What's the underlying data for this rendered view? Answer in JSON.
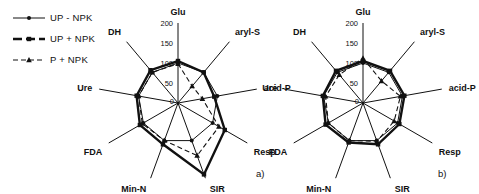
{
  "colors": {
    "line": "#111111",
    "background": "#ffffff"
  },
  "legend": {
    "items": [
      {
        "label": "UP - NPK",
        "marker": "circle",
        "line": "thin-solid"
      },
      {
        "label": "UP + NPK",
        "marker": "square",
        "line": "thick-solid"
      },
      {
        "label": "P + NPK",
        "marker": "triangle",
        "line": "dashed"
      }
    ]
  },
  "chart_data": [
    {
      "type": "radar",
      "label": "a)",
      "categories": [
        "Glu",
        "aryl-S",
        "acid-P",
        "Resp",
        "SIR",
        "Min-N",
        "FDA",
        "Ure",
        "DH"
      ],
      "ticks": [
        0,
        50,
        100,
        150,
        200
      ],
      "rlim": [
        0,
        200
      ],
      "grid": false,
      "legend_position": "top-left",
      "series": [
        {
          "name": "UP - NPK",
          "marker": "circle",
          "style": "thin-solid",
          "values": [
            100,
            100,
            100,
            100,
            100,
            100,
            100,
            100,
            100
          ]
        },
        {
          "name": "UP + NPK",
          "marker": "square",
          "style": "thick-solid",
          "values": [
            105,
            100,
            92,
            135,
            190,
            110,
            110,
            105,
            107
          ]
        },
        {
          "name": "P + NPK",
          "marker": "triangle",
          "style": "dashed",
          "values": [
            98,
            55,
            62,
            118,
            140,
            100,
            103,
            100,
            100
          ]
        }
      ]
    },
    {
      "type": "radar",
      "label": "b)",
      "categories": [
        "Glu",
        "aryl-S",
        "acid-P",
        "Resp",
        "SIR",
        "Min-N",
        "FDA",
        "Ure",
        "DH"
      ],
      "ticks": [
        0,
        50,
        100,
        150,
        200
      ],
      "rlim": [
        0,
        200
      ],
      "grid": false,
      "legend_position": "top-left",
      "series": [
        {
          "name": "UP - NPK",
          "marker": "circle",
          "style": "thin-solid",
          "values": [
            100,
            100,
            100,
            100,
            100,
            100,
            100,
            100,
            100
          ]
        },
        {
          "name": "UP + NPK",
          "marker": "square",
          "style": "thick-solid",
          "values": [
            105,
            105,
            105,
            105,
            110,
            105,
            108,
            102,
            105
          ]
        },
        {
          "name": "P + NPK",
          "marker": "triangle",
          "style": "dashed",
          "values": [
            112,
            72,
            95,
            90,
            102,
            100,
            100,
            95,
            92
          ]
        }
      ]
    }
  ]
}
